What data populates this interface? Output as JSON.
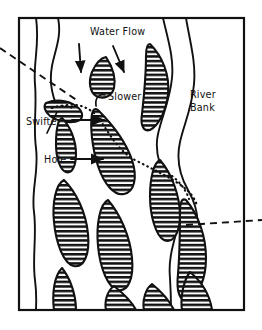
{
  "figure": {
    "background_color": "#ffffff",
    "ink_color": "#111111",
    "frame": {
      "name": "border-frame",
      "x": 19,
      "y": 18,
      "width": 225,
      "height": 292,
      "stroke_width": 2.2
    }
  },
  "labels": {
    "water_flow": "Water Flow",
    "slower": "Slower",
    "swifter": "Swifter",
    "hole": "Hole",
    "river_bank_line1": "River",
    "river_bank_line2": "Bank"
  },
  "label_positions": {
    "water_flow": {
      "x": 90,
      "y": 35
    },
    "slower": {
      "x": 108,
      "y": 100
    },
    "swifter": {
      "x": 26,
      "y": 125
    },
    "hole": {
      "x": 44,
      "y": 163
    },
    "river_bank_line1": {
      "x": 190,
      "y": 98
    },
    "river_bank_line2": {
      "x": 190,
      "y": 111
    }
  },
  "annotations": {
    "flow_arrows": [
      {
        "name": "flow-arrow-left",
        "x1": 79,
        "y1": 44,
        "x2": 81,
        "y2": 72
      },
      {
        "name": "flow-arrow-right",
        "x1": 113,
        "y1": 46,
        "x2": 124,
        "y2": 72
      }
    ],
    "pointer_arrows": [
      {
        "name": "swifter-pointer-arrow",
        "x1": 72,
        "y1": 120,
        "x2": 104,
        "y2": 120
      },
      {
        "name": "hole-pointer-arrow",
        "x1": 71,
        "y1": 159,
        "x2": 103,
        "y2": 159
      }
    ],
    "leaders": [
      {
        "name": "swifter-leader-line",
        "d": "M 47 133 L 57 112"
      },
      {
        "name": "slower-leader-hook",
        "d": "M 105 95 C 98 93 95 99 96 106"
      }
    ],
    "dashed_lines": [
      {
        "name": "dashed-line-left",
        "d": "M 0 48 L 78 101"
      },
      {
        "name": "dashed-line-right",
        "d": "M 186 225 L 262 220"
      }
    ],
    "dotted_current_line": {
      "name": "dotted-current-line",
      "d": "M 62 106 C 78 102 92 108 100 120 C 112 138 120 152 135 160 C 152 169 168 176 182 186 C 190 192 195 198 197 206"
    },
    "dotted_edge_highlights": [
      {
        "name": "dotted-edge-swifter",
        "d": "M 52 108 C 60 105 68 105 74 109"
      },
      {
        "name": "dotted-edge-right",
        "d": "M 172 176 C 180 182 186 190 189 199"
      }
    ]
  },
  "bank_lines": [
    {
      "name": "left-bank-line",
      "d": "M 36 18 C 40 45 33 62 35 84 C 37 108 33 126 36 148 C 39 172 31 190 34 212 C 37 236 32 258 35 280 C 37 296 36 304 36 310"
    },
    {
      "name": "right-bank-line-outer",
      "d": "M 186 18 C 190 42 196 62 194 84 C 192 108 184 124 180 142 C 176 160 180 176 188 190 C 196 204 200 218 196 234 C 192 250 186 266 188 284 C 189 298 189 305 189 310"
    },
    {
      "name": "right-bank-line-inner",
      "d": "M 163 18 C 168 40 174 58 172 78 C 170 100 162 116 158 134 C 154 152 160 168 168 182 C 176 196 182 210 178 226 C 174 242 168 258 170 278 C 171 294 171 304 171 310"
    },
    {
      "name": "left-channel-line",
      "d": "M 58 18 C 62 36 55 50 52 66 C 49 82 52 94 56 104"
    }
  ],
  "hatched_shapes": [
    {
      "name": "hatched-shape-swifter",
      "d": "M 46 103 C 56 99 68 100 76 106 C 82 110 84 116 80 120 C 72 124 58 122 50 116 C 45 112 43 106 46 103 Z"
    },
    {
      "name": "hatched-shape-slower-upper",
      "d": "M 106 57 C 112 66 116 78 114 88 C 112 96 104 100 96 96 C 90 92 88 82 92 72 C 96 63 101 58 106 57 Z"
    },
    {
      "name": "hatched-shape-top-right",
      "d": "M 150 44 C 162 56 170 74 168 94 C 166 112 158 126 150 130 C 144 132 140 126 142 114 C 144 96 146 72 146 56 C 146 48 147 44 150 44 Z"
    },
    {
      "name": "hatched-shape-left-mid",
      "d": "M 62 118 C 70 126 76 140 76 154 C 76 166 72 174 66 172 C 60 170 56 158 56 144 C 56 130 58 120 62 118 Z"
    },
    {
      "name": "hatched-shape-center-large",
      "d": "M 98 110 C 112 124 126 142 132 160 C 138 178 134 192 124 194 C 114 196 104 184 98 166 C 92 148 90 126 92 114 C 93 109 95 108 98 110 Z"
    },
    {
      "name": "hatched-shape-left-lower",
      "d": "M 64 180 C 76 192 86 212 88 234 C 90 254 84 268 74 266 C 64 264 56 244 54 222 C 52 202 56 184 64 180 Z"
    },
    {
      "name": "hatched-shape-center-lower",
      "d": "M 108 200 C 120 214 130 236 132 258 C 134 278 128 292 118 290 C 108 288 100 268 98 246 C 96 224 100 204 108 200 Z"
    },
    {
      "name": "hatched-shape-right-mid",
      "d": "M 160 160 C 172 174 180 196 180 216 C 180 234 172 244 164 240 C 156 236 150 216 150 196 C 150 178 154 162 160 160 Z"
    },
    {
      "name": "hatched-shape-right-lower",
      "d": "M 186 200 C 198 214 206 236 206 258 C 206 280 198 296 188 300 C 180 302 176 292 178 274 C 180 250 180 224 180 208 C 181 200 183 198 186 200 Z"
    },
    {
      "name": "hatched-shape-bottom-left",
      "d": "M 62 268 C 70 278 76 294 76 310 L 54 310 C 52 294 54 276 62 268 Z"
    },
    {
      "name": "hatched-shape-bottom-center",
      "d": "M 114 286 C 124 294 132 302 136 310 L 106 310 C 104 300 108 290 114 286 Z"
    },
    {
      "name": "hatched-shape-bottom-mid",
      "d": "M 152 284 C 162 292 170 302 174 310 L 144 310 C 142 300 146 288 152 284 Z"
    },
    {
      "name": "hatched-shape-bottom-right",
      "d": "M 190 272 C 202 282 210 296 212 310 L 182 310 C 180 296 184 280 190 272 Z"
    }
  ]
}
